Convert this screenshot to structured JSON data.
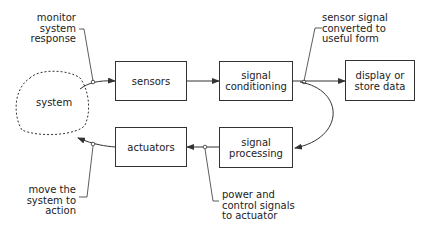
{
  "diagram": {
    "system": {
      "label": "system"
    },
    "blocks": [
      {
        "id": "sensors",
        "label": "sensors"
      },
      {
        "id": "signal-conditioning",
        "label_line1": "signal",
        "label_line2": "conditioning"
      },
      {
        "id": "display",
        "label_line1": "display or",
        "label_line2": "store data"
      },
      {
        "id": "actuators",
        "label": "actuators"
      },
      {
        "id": "signal-processing",
        "label_line1": "signal",
        "label_line2": "processing"
      }
    ],
    "annotations": {
      "monitor": {
        "line1": "monitor",
        "line2": "system",
        "line3": "response"
      },
      "sensor_signal": {
        "line1": "sensor signal",
        "line2": "converted to",
        "line3": "useful form"
      },
      "move": {
        "line1": "move the",
        "line2": "system to",
        "line3": "action"
      },
      "power": {
        "line1": "power and",
        "line2": "control signals",
        "line3": "to actuator"
      }
    },
    "edges": [
      {
        "from": "system",
        "to": "sensors"
      },
      {
        "from": "sensors",
        "to": "signal-conditioning"
      },
      {
        "from": "signal-conditioning",
        "to": "display"
      },
      {
        "from": "signal-conditioning",
        "to": "signal-processing"
      },
      {
        "from": "signal-processing",
        "to": "actuators"
      },
      {
        "from": "actuators",
        "to": "system"
      }
    ],
    "colors": {
      "line": "#333333",
      "background": "#ffffff"
    }
  }
}
